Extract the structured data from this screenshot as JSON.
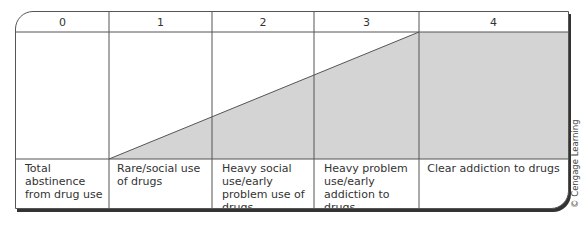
{
  "diagram": {
    "title": "",
    "stages": [
      {
        "number": "0",
        "label": "Total abstinence from drug use"
      },
      {
        "number": "1",
        "label": "Rare/social use of drugs"
      },
      {
        "number": "2",
        "label": "Heavy social use/early problem use of drugs"
      },
      {
        "number": "3",
        "label": "Heavy problem use/early addiction to drugs"
      },
      {
        "number": "4",
        "label": "Clear addiction to drugs"
      }
    ],
    "shading": {
      "description": "Shaded area rises linearly from stage 1 to stage 3, then stays at maximum through stage 4",
      "fill_color": "#d4d4d4",
      "start_stage": "1",
      "peak_stage": "3"
    },
    "credit": "© Cengage Learning"
  },
  "colors": {
    "border": "#555555",
    "shadow": "#333333",
    "shade": "#d4d4d4",
    "text": "#333333"
  }
}
